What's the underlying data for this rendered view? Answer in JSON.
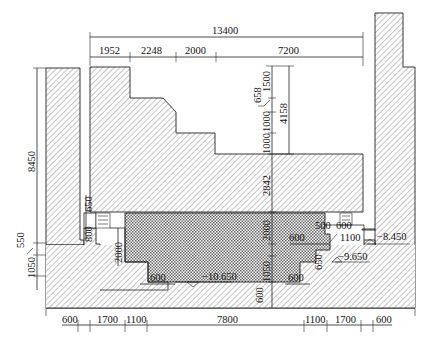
{
  "drawing": {
    "title": "Cross-section of foundation pit / structure",
    "colors": {
      "line": "#222222",
      "hatch": "#555555",
      "background": "#ffffff"
    },
    "dimensions_top": {
      "overall": "13400",
      "segments": [
        "1952",
        "2248",
        "2000",
        "7200"
      ]
    },
    "dimensions_upper_right": {
      "seg_1500": "1500",
      "seg_658": "658",
      "seg_1000a": "1000",
      "seg_1000b": "1000",
      "total_4158": "4158",
      "seg_2842": "2842"
    },
    "dimensions_left": {
      "height_8450": "8450",
      "seg_550": "550",
      "seg_1050": "1050",
      "seg_650": "650",
      "seg_800": "800",
      "seg_2000": "2000"
    },
    "dimensions_center": {
      "seg_2000": "2000",
      "seg_1050": "1050",
      "seg_600_bottom": "600",
      "seg_600_left": "600",
      "seg_600_right": "600",
      "seg_600_mid": "600",
      "seg_500": "500",
      "seg_600_top": "600",
      "seg_1100": "1100",
      "seg_650": "650"
    },
    "elevations": {
      "el_8450": "−8.450",
      "el_9650": "−9.650",
      "el_10650": "−10.650"
    },
    "dimensions_bottom": {
      "segments": [
        "600",
        "1700",
        "1100",
        "7800",
        "1100",
        "1700",
        "600"
      ]
    }
  }
}
